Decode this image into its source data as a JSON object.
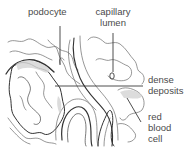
{
  "diagram": {
    "labels": {
      "podocyte": "podocyte",
      "capillary_lumen_1": "capillary",
      "capillary_lumen_2": "lumen",
      "dense_deposits_1": "dense",
      "dense_deposits_2": "deposits",
      "red_blood_cell_1": "red",
      "red_blood_cell_2": "blood",
      "red_blood_cell_3": "cell"
    },
    "colors": {
      "line": "#555555",
      "text": "#4a4a4a",
      "shade": "#d8d8d8",
      "background": "#ffffff"
    }
  }
}
